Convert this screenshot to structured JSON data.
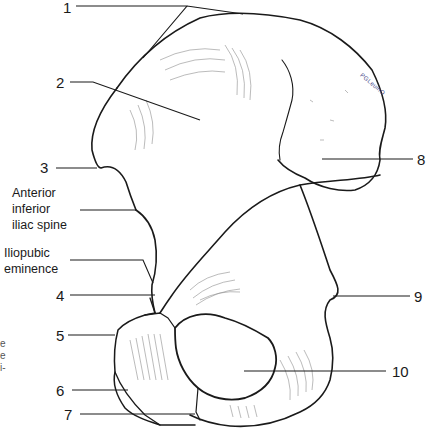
{
  "figure": {
    "numbered_labels": [
      {
        "id": "1",
        "text": "1"
      },
      {
        "id": "2",
        "text": "2"
      },
      {
        "id": "3",
        "text": "3"
      },
      {
        "id": "4",
        "text": "4"
      },
      {
        "id": "5",
        "text": "5"
      },
      {
        "id": "6",
        "text": "6"
      },
      {
        "id": "7",
        "text": "7"
      },
      {
        "id": "8",
        "text": "8"
      },
      {
        "id": "9",
        "text": "9"
      },
      {
        "id": "10",
        "text": "10"
      }
    ],
    "named_labels": {
      "anterior_inferior_iliac_spine": [
        "Anterior",
        "inferior",
        "iliac spine"
      ],
      "iliopubic_eminence": [
        "Iliopubic",
        "eminence"
      ]
    },
    "cut_off_text": [
      "e",
      "e",
      "i-"
    ],
    "signature": "PGLeuinO"
  }
}
